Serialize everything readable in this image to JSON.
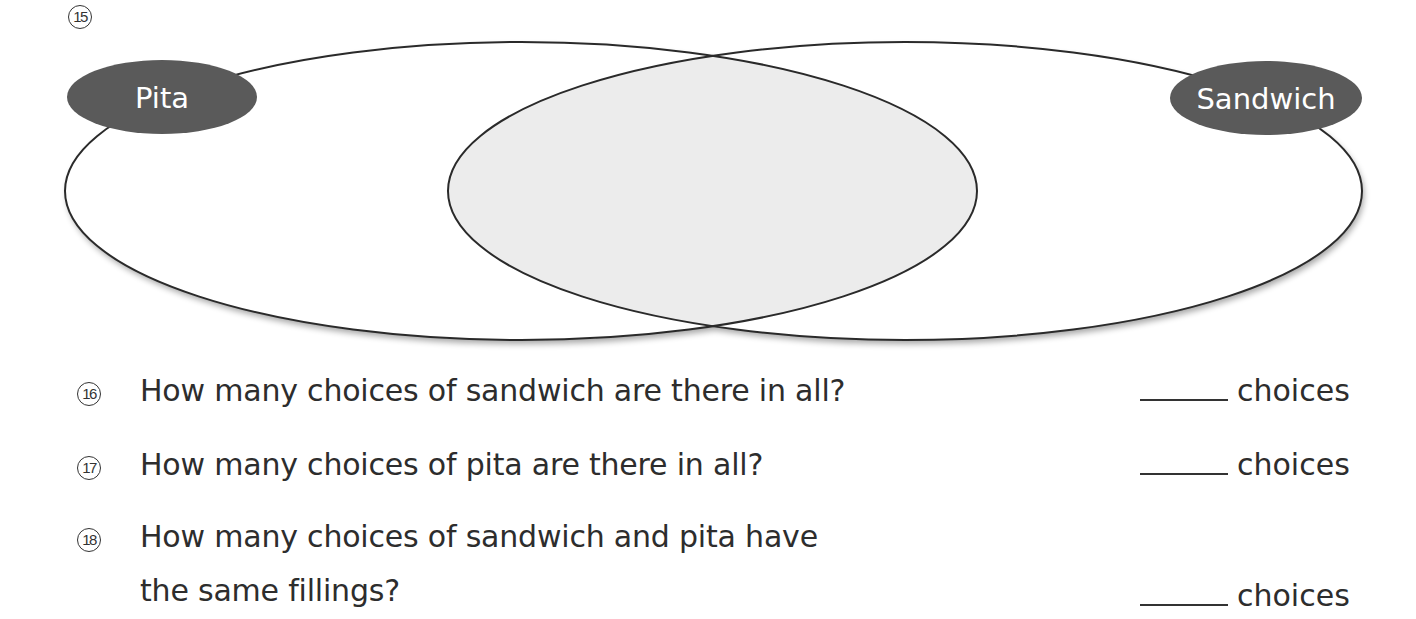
{
  "diagram": {
    "number": "15",
    "type": "venn",
    "sets": [
      {
        "label": "Pita",
        "color": "#5a5a5a"
      },
      {
        "label": "Sandwich",
        "color": "#5a5a5a"
      }
    ],
    "intersection_fill": "#ececec"
  },
  "questions": [
    {
      "number": "16",
      "text": "How many choices of sandwich are there in all?",
      "answer_unit": "choices"
    },
    {
      "number": "17",
      "text": "How many choices of pita are there in all?",
      "answer_unit": "choices"
    },
    {
      "number": "18",
      "text_line1": "How many choices of sandwich and pita have",
      "text_line2": "the same fillings?",
      "answer_unit": "choices"
    }
  ]
}
